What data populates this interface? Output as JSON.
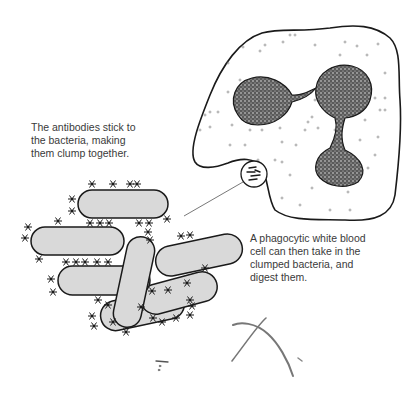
{
  "captions": {
    "antibodies": "The antibodies stick to\nthe bacteria, making\nthem clump together.",
    "phagocyte": "A phagocytic white blood\ncell can then take in the\nclumped bacteria, and\ndigest them."
  },
  "colors": {
    "outline": "#1a1a1a",
    "bacteria_fill": "#d9d9d9",
    "nucleus_fill": "#3a3a3a",
    "text": "#3a3a3a",
    "debris": "#8a8a8a"
  }
}
